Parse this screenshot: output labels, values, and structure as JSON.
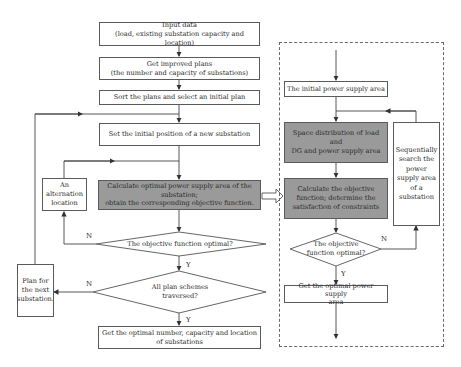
{
  "diagram": {
    "type": "flowchart",
    "main_flow": {
      "input_data": {
        "line1": "Input data",
        "line2": "(load, existing substation capacity and location)"
      },
      "improved_plans": {
        "line1": "Get improved plans",
        "line2": "(the number and capacity of substations)"
      },
      "sort_plans": "Sort the plans and select an initial plan",
      "set_position": "Set the initial position of a new substation",
      "calculate_area": {
        "line1": "Calculate optimal power supply area of the",
        "line2": "substation;",
        "line3": "obtain the corresponding objective function."
      },
      "alternation": {
        "line1": "An",
        "line2": "alternation",
        "line3": "location"
      },
      "decision_optimal": "The objective function optimal?",
      "decision_traversed": {
        "line1": "All plan schemes",
        "line2": "traversed?"
      },
      "next_plan": {
        "line1": "Plan for",
        "line2": "the next",
        "line3": "substation."
      },
      "result": {
        "line1": "Get the optimal number, capacity and location",
        "line2": "of substations"
      },
      "label_n1": "N",
      "label_y1": "Y",
      "label_n2": "N",
      "label_y2": "Y"
    },
    "sub_flow": {
      "initial_area": "The initial power supply area",
      "space_distribution": {
        "line1": "Space distribution of load and",
        "line2": "DG and power supply area"
      },
      "calc_objective": {
        "line1": "Calculate the objective",
        "line2": "function; determine the",
        "line3": "satisfaction of constraints"
      },
      "sequential_search": {
        "line1": "Sequentially",
        "line2": "search the",
        "line3": "power",
        "line4": "supply area",
        "line5": "of a",
        "line6": "substation"
      },
      "decision_optimal": {
        "line1": "The objective",
        "line2": "function optimal?"
      },
      "result": {
        "line1": "Get the optimal power supply",
        "line2": "area"
      },
      "label_n": "N",
      "label_y": "Y"
    },
    "colors": {
      "highlight_fill": "#9a9a9a",
      "border": "#5a5a5a",
      "background": "#ffffff"
    }
  }
}
